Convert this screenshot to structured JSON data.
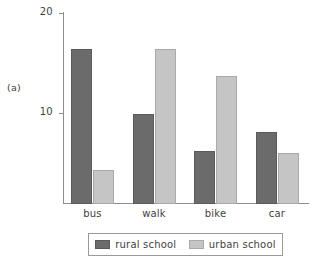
{
  "figure": {
    "panel_label": "(a)"
  },
  "chart_data": {
    "type": "bar",
    "title": "",
    "xlabel": "",
    "ylabel": "",
    "categories": [
      "bus",
      "walk",
      "bike",
      "car"
    ],
    "series": [
      {
        "name": "rural school",
        "color": "#6b6b6b",
        "values": [
          16.5,
          10,
          6.3,
          8.2
        ]
      },
      {
        "name": "urban school",
        "color": "#c5c5c5",
        "values": [
          4.4,
          16.5,
          13.8,
          6.1
        ]
      }
    ],
    "ylim": [
      1,
      20.1
    ],
    "yticks": [
      10,
      20
    ],
    "ytick_labels": [
      "10",
      "20"
    ],
    "grid": false,
    "legend_position": "bottom"
  }
}
